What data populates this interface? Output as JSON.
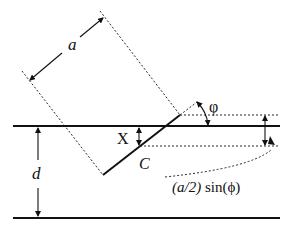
{
  "diagram": {
    "labels": {
      "a": "a",
      "d": "d",
      "x": "X",
      "c": "C",
      "phi": "φ",
      "formula_italic": "(a/2)",
      "formula_rest": " sin(ϕ)"
    },
    "colors": {
      "line": "#111111",
      "background": "#ffffff"
    }
  }
}
